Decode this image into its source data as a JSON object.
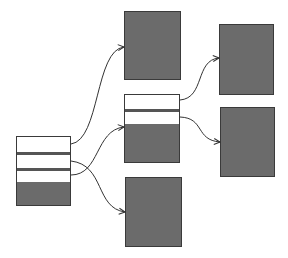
{
  "diagram": {
    "type": "pointer-structure",
    "colors": {
      "background": "#ffffff",
      "block_fill": "#6b6b6b",
      "block_border": "#3a3a3a",
      "separator": "#555555",
      "edge": "#333333"
    },
    "nodes": [
      {
        "id": "root-record",
        "kind": "record",
        "x": 16,
        "y": 136,
        "w": 55,
        "h": 70,
        "fields": [
          {
            "kind": "white",
            "y": 0,
            "h": 15
          },
          {
            "kind": "sep",
            "y": 15,
            "h": 3
          },
          {
            "kind": "white",
            "y": 18,
            "h": 13
          },
          {
            "kind": "sep",
            "y": 31,
            "h": 3
          },
          {
            "kind": "white",
            "y": 34,
            "h": 11
          },
          {
            "kind": "dark",
            "y": 45,
            "h": 25
          }
        ]
      },
      {
        "id": "top-block",
        "kind": "block",
        "x": 124,
        "y": 11,
        "w": 57,
        "h": 69
      },
      {
        "id": "middle-record",
        "kind": "record",
        "x": 124,
        "y": 94,
        "w": 56,
        "h": 69,
        "fields": [
          {
            "kind": "white",
            "y": 0,
            "h": 14
          },
          {
            "kind": "sep",
            "y": 14,
            "h": 3
          },
          {
            "kind": "white",
            "y": 17,
            "h": 12
          },
          {
            "kind": "dark",
            "y": 29,
            "h": 40
          }
        ]
      },
      {
        "id": "bottom-block",
        "kind": "block",
        "x": 125,
        "y": 177,
        "w": 57,
        "h": 70
      },
      {
        "id": "right-top-block",
        "kind": "block",
        "x": 219,
        "y": 24,
        "w": 55,
        "h": 71
      },
      {
        "id": "right-bottom-block",
        "kind": "block",
        "x": 220,
        "y": 107,
        "w": 55,
        "h": 70
      }
    ],
    "edges": [
      {
        "from": "root-record.field1",
        "to": "top-block",
        "path": "M71,144 C100,140 95,50 124,47"
      },
      {
        "from": "root-record.field2",
        "to": "bottom-block",
        "path": "M71,161 C105,165 95,208 125,212"
      },
      {
        "from": "root-record.field3",
        "to": "middle-record",
        "path": "M71,175 C100,175 95,130 124,127"
      },
      {
        "from": "middle-record.field1",
        "to": "right-top-block",
        "path": "M180,100 C205,98 195,60 219,58"
      },
      {
        "from": "middle-record.field2",
        "to": "right-bottom-block",
        "path": "M180,117 C205,118 195,140 220,142"
      }
    ]
  }
}
